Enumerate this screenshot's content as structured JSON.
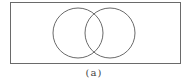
{
  "diagram": {
    "type": "venn",
    "caption": "(a)",
    "colors": {
      "stroke": "#6a6a6a",
      "background": "#ffffff"
    },
    "universe": {
      "x": 10,
      "y": 2,
      "width": 170,
      "height": 61
    },
    "sets": [
      {
        "cx": 78,
        "cy": 33,
        "r": 25
      },
      {
        "cx": 110,
        "cy": 33,
        "r": 25
      }
    ]
  }
}
